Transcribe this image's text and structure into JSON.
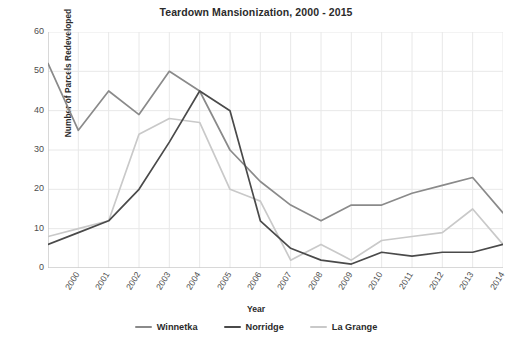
{
  "chart_data": {
    "type": "line",
    "title": "Teardown Mansionization, 2000 - 2015",
    "xlabel": "Year",
    "ylabel": "Number of Parcels Redeveloped",
    "categories": [
      "2000",
      "2001",
      "2002",
      "2003",
      "2004",
      "2005",
      "2006",
      "2007",
      "2008",
      "2009",
      "2010",
      "2011",
      "2012",
      "2013",
      "2014",
      "2015"
    ],
    "x": [
      2000,
      2001,
      2002,
      2003,
      2004,
      2005,
      2006,
      2007,
      2008,
      2009,
      2010,
      2011,
      2012,
      2013,
      2014,
      2015
    ],
    "ylim": [
      0,
      60
    ],
    "xlim": [
      2000,
      2015
    ],
    "yticks": [
      0,
      10,
      20,
      30,
      40,
      50,
      60
    ],
    "ytick_labels": [
      "0",
      "10",
      "20",
      "30",
      "40",
      "50",
      "60"
    ],
    "grid": true,
    "grid_color": "#e8e8e8",
    "legend_position": "bottom",
    "series": [
      {
        "name": "Winnetka",
        "color": "#8a8a8a",
        "values": [
          52,
          35,
          45,
          39,
          50,
          45,
          30,
          22,
          16,
          12,
          16,
          16,
          19,
          21,
          23,
          14
        ]
      },
      {
        "name": "Norridge",
        "color": "#4a4a4a",
        "values": [
          6,
          9,
          12,
          20,
          32,
          45,
          40,
          12,
          5,
          2,
          1,
          4,
          3,
          4,
          4,
          6
        ]
      },
      {
        "name": "La Grange",
        "color": "#c9c9c9",
        "values": [
          8,
          10,
          12,
          34,
          38,
          37,
          20,
          17,
          2,
          6,
          2,
          7,
          8,
          9,
          15,
          6
        ]
      }
    ]
  },
  "legend": {
    "items": [
      {
        "label": "Winnetka",
        "color": "#8a8a8a"
      },
      {
        "label": "Norridge",
        "color": "#4a4a4a"
      },
      {
        "label": "La Grange",
        "color": "#c9c9c9"
      }
    ]
  }
}
